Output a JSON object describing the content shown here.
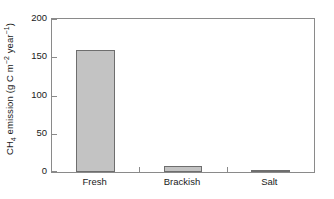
{
  "chart_data": {
    "type": "bar",
    "title": "",
    "xlabel": "",
    "ylabel": "CH4 emission (g C m-2 year-1)",
    "ylabel_parts": {
      "prefix": "CH",
      "sub1": "4",
      "mid": " emission (g C m",
      "sup1": "−2",
      "mid2": " year",
      "sup2": "−1",
      "suffix": ")"
    },
    "categories": [
      "Fresh",
      "Brackish",
      "Salt"
    ],
    "values": [
      160,
      8,
      3
    ],
    "ylim": [
      0,
      200
    ],
    "yticks": [
      0,
      50,
      100,
      150,
      200
    ],
    "ytick_labels": [
      "0",
      "50",
      "100",
      "150",
      "200"
    ],
    "grid": false,
    "legend": false,
    "bar_fill": "#c3c3c3",
    "bar_edge": "#6e6e6e",
    "axis_color": "#8a8a8a",
    "background": "#ffffff"
  }
}
